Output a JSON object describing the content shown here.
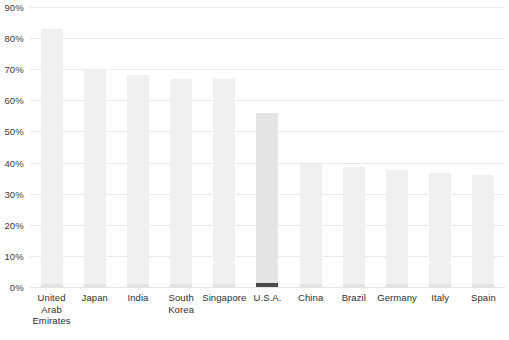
{
  "chart_data": {
    "type": "bar",
    "title": "",
    "xlabel": "",
    "ylabel": "",
    "ylim": [
      0,
      90
    ],
    "ytick_step": 10,
    "grid": true,
    "legend": false,
    "ytick_labels": [
      "0%",
      "10%",
      "20%",
      "30%",
      "40%",
      "50%",
      "60%",
      "70%",
      "80%",
      "90%"
    ],
    "ytick_values": [
      0,
      10,
      20,
      30,
      40,
      50,
      60,
      70,
      80,
      90
    ],
    "categories": [
      "United Arab Emirates",
      "Japan",
      "India",
      "South Korea",
      "Singapore",
      "U.S.A.",
      "China",
      "Brazil",
      "Germany",
      "Italy",
      "Spain"
    ],
    "category_lines": [
      [
        "United",
        "Arab",
        "Emirates"
      ],
      [
        "Japan"
      ],
      [
        "India"
      ],
      [
        "South",
        "Korea"
      ],
      [
        "Singapore"
      ],
      [
        "U.S.A."
      ],
      [
        "China"
      ],
      [
        "Brazil"
      ],
      [
        "Germany"
      ],
      [
        "Italy"
      ],
      [
        "Spain"
      ]
    ],
    "values": [
      83,
      70,
      68,
      67,
      67,
      56,
      39.5,
      38.5,
      37.5,
      36.5,
      36
    ],
    "highlighted_category": "U.S.A.",
    "highlighted_index": 5,
    "colors": {
      "bar": "#f0f0f0",
      "bar_highlight": "#e4e4e4",
      "bar_base": "#e2e2e2",
      "bar_base_highlight": "#4a4a4a",
      "gridline": "#e9e9e9",
      "label_text": "#2e2e2e",
      "background": "#ffffff"
    }
  }
}
